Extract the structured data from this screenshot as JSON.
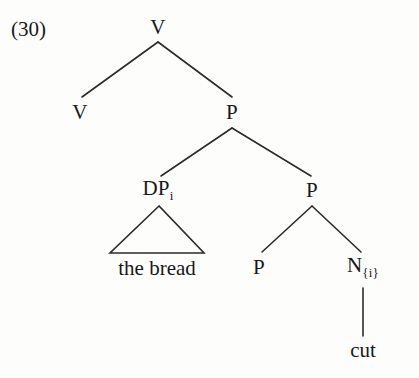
{
  "figure": {
    "example_number": "(30)",
    "type": "syntax-tree",
    "background_color": "#fdfdfb",
    "line_color": "#2b2b2e",
    "text_color": "#18181a"
  },
  "nodes": {
    "root_v": {
      "label": "V",
      "x": 158,
      "y": 27
    },
    "left_v": {
      "label": "V",
      "x": 80,
      "y": 112
    },
    "upper_p": {
      "label": "P",
      "x": 232,
      "y": 112
    },
    "dp": {
      "label": "DP",
      "subscript": "i",
      "x": 158,
      "y": 190
    },
    "mid_p": {
      "label": "P",
      "x": 312,
      "y": 190
    },
    "lower_p": {
      "label": "P",
      "x": 259,
      "y": 267
    },
    "n": {
      "label": "N",
      "subscript": "{i}",
      "x": 363,
      "y": 267
    }
  },
  "terminals": {
    "bread": {
      "label": "the bread",
      "x": 157,
      "y": 268
    },
    "cut": {
      "label": "cut",
      "x": 363,
      "y": 350
    }
  },
  "edges": [
    {
      "name": "root-to-left-v",
      "x1": 158,
      "y1": 42,
      "x2": 82,
      "y2": 97
    },
    {
      "name": "root-to-upper-p",
      "x1": 158,
      "y1": 42,
      "x2": 232,
      "y2": 97
    },
    {
      "name": "upper-p-to-dp",
      "x1": 232,
      "y1": 128,
      "x2": 161,
      "y2": 176
    },
    {
      "name": "upper-p-to-mid-p",
      "x1": 232,
      "y1": 128,
      "x2": 311,
      "y2": 176
    },
    {
      "name": "mid-p-to-lower-p",
      "x1": 312,
      "y1": 206,
      "x2": 262,
      "y2": 252
    },
    {
      "name": "mid-p-to-n",
      "x1": 312,
      "y1": 206,
      "x2": 361,
      "y2": 252
    },
    {
      "name": "n-to-cut",
      "x1": 363,
      "y1": 288,
      "x2": 363,
      "y2": 336
    }
  ],
  "triangle": {
    "name": "dp-triangle",
    "apex_x": 159,
    "apex_y": 206,
    "left_x": 110,
    "right_x": 204,
    "base_y": 253
  }
}
